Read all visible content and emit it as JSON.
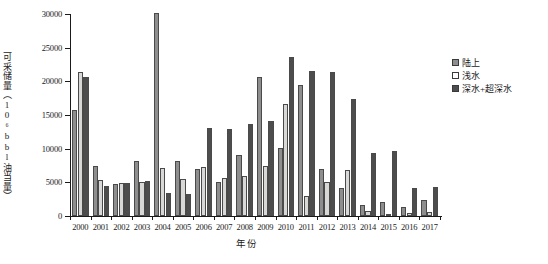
{
  "chart_data": {
    "type": "bar",
    "title": "",
    "xlabel": "年份",
    "ylabel": "可采储量（10⁶bbl油当量）",
    "ylim": [
      0,
      30000
    ],
    "yticks": [
      0,
      5000,
      10000,
      15000,
      20000,
      25000,
      30000
    ],
    "ytick_labels": [
      "0",
      "5000",
      "10000",
      "15000",
      "20000",
      "25000",
      "30000"
    ],
    "grid": false,
    "legend_position": "top-right",
    "categories": [
      "2000",
      "2001",
      "2002",
      "2003",
      "2004",
      "2005",
      "2006",
      "2007",
      "2008",
      "2009",
      "2010",
      "2011",
      "2012",
      "2013",
      "2014",
      "2015",
      "2016",
      "2017"
    ],
    "series": [
      {
        "name": "陆上",
        "color": "#8e8e8e",
        "values": [
          15700,
          7500,
          4800,
          8200,
          30100,
          8100,
          7000,
          5000,
          9000,
          20700,
          10100,
          19400,
          7000,
          4100,
          1700,
          2100,
          1300,
          2400
        ]
      },
      {
        "name": "浅水",
        "color": "#ffffff",
        "values": [
          21400,
          5400,
          4900,
          5100,
          7200,
          5500,
          7300,
          5600,
          5900,
          7500,
          16700,
          3000,
          5100,
          6900,
          700,
          300,
          500,
          600
        ]
      },
      {
        "name": "深水+超深水",
        "color": "#4d4d4d",
        "values": [
          20600,
          4400,
          4900,
          5200,
          3400,
          3300,
          13000,
          12900,
          13700,
          14100,
          23600,
          21500,
          21400,
          17400,
          9300,
          9600,
          4100,
          4300
        ]
      }
    ]
  }
}
